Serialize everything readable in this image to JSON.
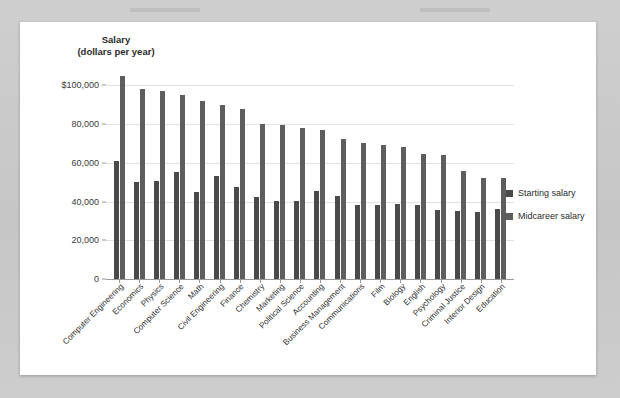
{
  "chart_data": {
    "type": "bar",
    "title": "",
    "ylabel_lines": [
      "Salary",
      "(dollars per year)"
    ],
    "xlabel": "",
    "ylim": [
      0,
      110000
    ],
    "grid": true,
    "legend_position": "right",
    "ytick_labels": [
      "$100,000",
      "80,000",
      "60,000",
      "40,000",
      "20,000",
      "0"
    ],
    "ytick_values": [
      100000,
      80000,
      60000,
      40000,
      20000,
      0
    ],
    "categories": [
      "Computer Engineering",
      "Economics",
      "Physics",
      "Computer Science",
      "Math",
      "Civil Engineering",
      "Finance",
      "Chemistry",
      "Marketing",
      "Political Science",
      "Accounting",
      "Business Management",
      "Communications",
      "Film",
      "Biology",
      "English",
      "Psychology",
      "Criminal Justice",
      "Interior Design",
      "Education"
    ],
    "series": [
      {
        "name": "Starting salary",
        "color": "#4a4a4a",
        "values": [
          61000,
          50000,
          50500,
          55500,
          45000,
          53000,
          47500,
          42500,
          40500,
          40500,
          45500,
          43000,
          38000,
          38000,
          38500,
          38000,
          35500,
          35000,
          34500,
          36000
        ]
      },
      {
        "name": "Midcareer salary",
        "color": "#5e5e5e",
        "values": [
          105000,
          98000,
          97000,
          95000,
          92000,
          90000,
          88000,
          80000,
          79500,
          78000,
          77000,
          72500,
          70000,
          69000,
          68000,
          64500,
          64000,
          56000,
          52000,
          52000
        ]
      }
    ]
  },
  "legend": {
    "items": [
      {
        "label": "Starting salary",
        "color": "#4a4a4a"
      },
      {
        "label": "Midcareer salary",
        "color": "#5e5e5e"
      }
    ]
  }
}
